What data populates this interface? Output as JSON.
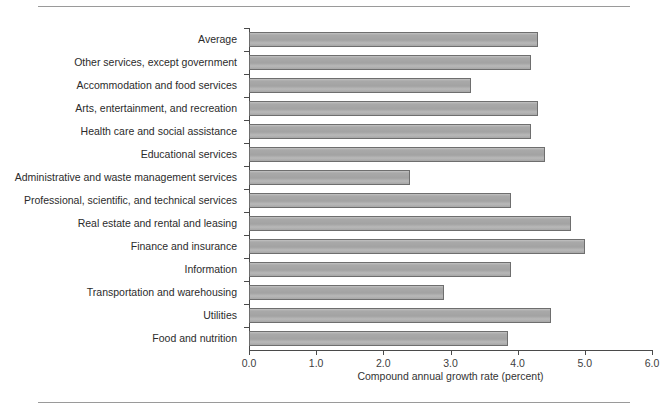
{
  "chart_data": {
    "type": "bar",
    "orientation": "horizontal",
    "title": "",
    "subtitle": "",
    "xlabel": "Compound annual growth rate (percent)",
    "ylabel": "",
    "xlim": [
      0.0,
      6.0
    ],
    "xticks": [
      "0.0",
      "1.0",
      "2.0",
      "3.0",
      "4.0",
      "5.0",
      "6.0"
    ],
    "xtick_values": [
      0.0,
      1.0,
      2.0,
      3.0,
      4.0,
      5.0,
      6.0
    ],
    "grid": false,
    "legend": null,
    "bar_color": "#a9a9a9",
    "bar_border_color": "#6e6e6e",
    "axis_color": "#4a4a4a",
    "categories": [
      "Average",
      "Other services, except government",
      "Accommodation and food services",
      "Arts, entertainment, and recreation",
      "Health care and social assistance",
      "Educational services",
      "Administrative and waste management services",
      "Professional, scientific, and technical services",
      "Real estate and rental and leasing",
      "Finance and insurance",
      "Information",
      "Transportation and warehousing",
      "Utilities",
      "Food and nutrition"
    ],
    "values": [
      4.3,
      4.2,
      3.3,
      4.3,
      4.2,
      4.4,
      2.4,
      3.9,
      4.8,
      5.0,
      3.9,
      2.9,
      4.5,
      3.85
    ]
  }
}
